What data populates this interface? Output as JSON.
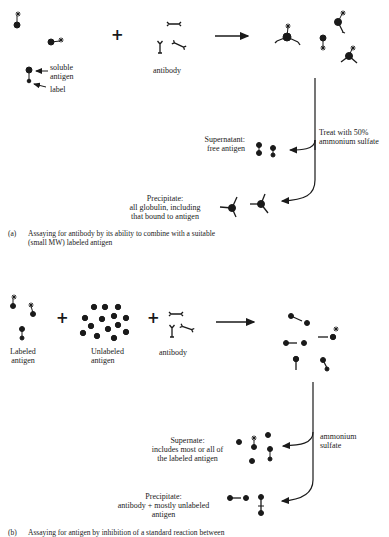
{
  "panel_a": {
    "labels": {
      "soluble_antigen": "soluble\nantigen",
      "label": "label",
      "antibody": "antibody",
      "treatment": "Treat with 50%\nammonium sulfate",
      "supernatant": "Supernatant:\nfree antigen",
      "precipitate": "Precipitate:\nall globulin, including\nthat bound to antigen"
    },
    "plus": "+",
    "caption_marker": "(a)",
    "caption": "Assaying for antibody by its ability to combine with a suitable\n(small MW) labeled antigen"
  },
  "panel_b": {
    "labels": {
      "labeled_antigen": "Labeled\nantigen",
      "unlabeled_antigen": "Unlabeled\nantigen",
      "antibody": "antibody",
      "treatment": "ammonium\nsulfate",
      "supernate": "Supernate:\nincludes most or all of\nthe labeled antigen",
      "precipitate": "Precipitate:\nantibody + mostly unlabeled\nantigen"
    },
    "plus1": "+",
    "plus2": "+",
    "caption_marker": "(b)",
    "caption": "Assaying for antigen by inhibition of a standard reaction between"
  },
  "colors": {
    "ink": "#1a1a1a",
    "background": "#ffffff"
  }
}
